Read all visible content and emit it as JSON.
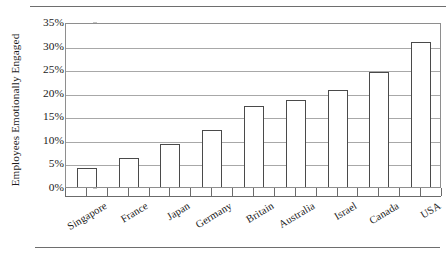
{
  "chart_data": {
    "type": "bar",
    "title": "",
    "subtitle": "",
    "xlabel": "",
    "ylabel": "Employees Emotionally Engaged",
    "categories": [
      "Singapore",
      "France",
      "Japan",
      "Germany",
      "Britain",
      "Australia",
      "Israel",
      "Canada",
      "USA"
    ],
    "values": [
      4.1,
      6.2,
      9.2,
      12.1,
      17.2,
      18.4,
      20.5,
      24.5,
      30.7
    ],
    "value_labels": [
      "4.1%",
      "6.2%",
      "9.2%",
      "12.1%",
      "17.2%",
      "18.4%",
      "20.5%",
      "24.5%",
      "30.7%"
    ],
    "ylim": [
      0,
      35
    ],
    "ytick_values": [
      0,
      5,
      10,
      15,
      20,
      25,
      30,
      35
    ],
    "ytick_labels": [
      "0%",
      "5%",
      "10%",
      "15%",
      "20%",
      "25%",
      "30%",
      "35%"
    ],
    "grid": true,
    "grid_axis": "y",
    "legend": false,
    "legend_position": "none",
    "bar_fill_color": "#ffffff",
    "bar_border_color": "#4a4a4a",
    "gridline_color": "#a8a8a8",
    "axis_color": "#8e8e8e",
    "text_color": "#1a1a1a",
    "xlabel_rotation_degrees": -31
  },
  "decorations": {
    "top_rule": "horizontal-rule",
    "bottom_rule": "horizontal-rule"
  }
}
